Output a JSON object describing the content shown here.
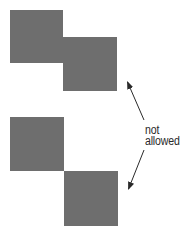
{
  "diagram": {
    "fill_color": "#6e6e6e",
    "line_color": "#2a2a2a",
    "groups": [
      {
        "name": "top-pair",
        "squares": [
          {
            "x": 10,
            "y": 10,
            "size": 53
          },
          {
            "x": 63,
            "y": 37,
            "size": 54
          }
        ]
      },
      {
        "name": "bottom-pair",
        "squares": [
          {
            "x": 10,
            "y": 117,
            "size": 54
          },
          {
            "x": 64,
            "y": 171,
            "size": 54
          }
        ]
      }
    ],
    "annotation": {
      "line1": "not",
      "line2": "allowed"
    },
    "arrows": [
      {
        "name": "arrow-up",
        "from": [
          144,
          120
        ],
        "to": [
          127,
          81
        ]
      },
      {
        "name": "arrow-down",
        "from": [
          144,
          150
        ],
        "to": [
          128,
          190
        ]
      }
    ]
  }
}
